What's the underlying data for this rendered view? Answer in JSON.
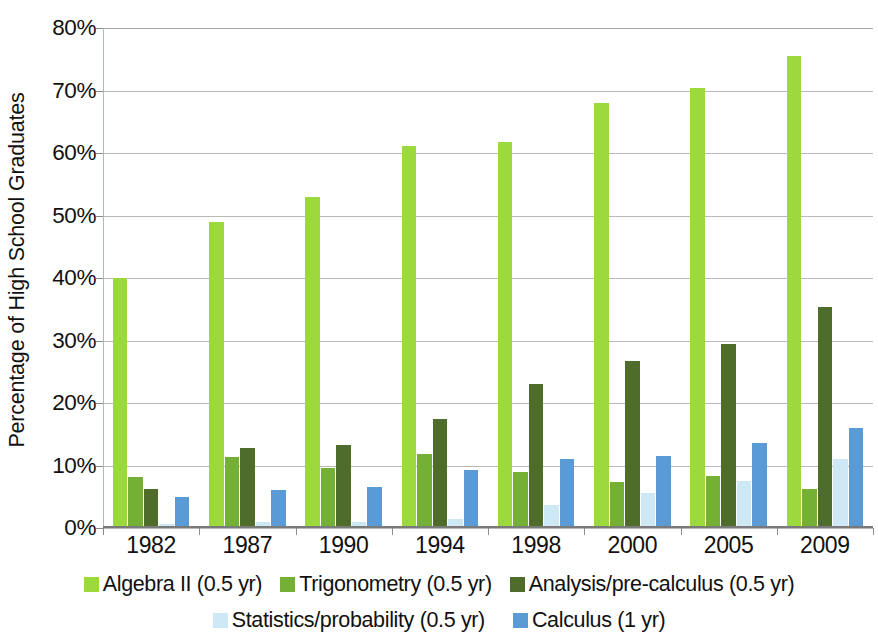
{
  "chart_data": {
    "type": "bar",
    "title": "",
    "subtitle": "",
    "xlabel": "",
    "ylabel": "Percentage of High School Graduates",
    "categories": [
      "1982",
      "1987",
      "1990",
      "1994",
      "1998",
      "2000",
      "2005",
      "2009"
    ],
    "ylim": [
      0,
      80
    ],
    "ytick_labels": [
      "0%",
      "10%",
      "20%",
      "30%",
      "40%",
      "50%",
      "60%",
      "70%",
      "80%"
    ],
    "ytick_values": [
      0,
      10,
      20,
      30,
      40,
      50,
      60,
      70,
      80
    ],
    "grid": true,
    "legend_position": "bottom",
    "series": [
      {
        "name": "Algebra II (0.5 yr)",
        "color": "#9BD93C",
        "values": [
          40.0,
          49.0,
          53.0,
          61.2,
          61.7,
          68.0,
          70.4,
          75.6
        ]
      },
      {
        "name": "Trigonometry (0.5 yr)",
        "color": "#74B035",
        "values": [
          8.1,
          11.4,
          9.6,
          11.8,
          8.9,
          7.4,
          8.4,
          6.2
        ]
      },
      {
        "name": "Analysis/pre-calculus (0.5 yr)",
        "color": "#4E6D2B",
        "values": [
          6.2,
          12.8,
          13.3,
          17.4,
          23.1,
          26.7,
          29.5,
          35.3
        ]
      },
      {
        "name": "Statistics/probability (0.5 yr)",
        "color": "#CFE8F5",
        "values": [
          0.6,
          0.9,
          1.0,
          1.5,
          3.7,
          5.6,
          7.6,
          11.0
        ]
      },
      {
        "name": "Calculus (1 yr)",
        "color": "#5B9BD5",
        "values": [
          4.9,
          6.1,
          6.6,
          9.3,
          11.0,
          11.6,
          13.6,
          16.0
        ]
      }
    ]
  },
  "axis": {
    "y_title": "Percentage of High School Graduates"
  },
  "legend": {
    "row1": [
      {
        "label": "Algebra II (0.5 yr)",
        "color": "#9BD93C"
      },
      {
        "label": "Trigonometry (0.5 yr)",
        "color": "#74B035"
      },
      {
        "label": "Analysis/pre-calculus (0.5 yr)",
        "color": "#4E6D2B"
      }
    ],
    "row2": [
      {
        "label": "Statistics/probability (0.5 yr)",
        "color": "#CFE8F5"
      },
      {
        "label": "Calculus (1 yr)",
        "color": "#5B9BD5"
      }
    ]
  }
}
